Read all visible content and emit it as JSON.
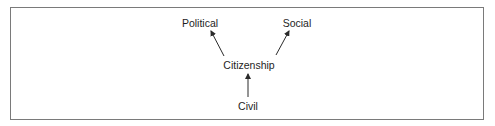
{
  "diagram": {
    "nodes": [
      {
        "id": "political",
        "label": "Political"
      },
      {
        "id": "social",
        "label": "Social"
      },
      {
        "id": "citizenship",
        "label": "Citizenship"
      },
      {
        "id": "civil",
        "label": "Civil"
      }
    ],
    "edges": [
      {
        "from": "citizenship",
        "to": "political"
      },
      {
        "from": "citizenship",
        "to": "social"
      },
      {
        "from": "civil",
        "to": "citizenship"
      }
    ],
    "colors": {
      "border": "#7a7a7a",
      "text": "#1e1e1e",
      "arrow": "#2a2a2a"
    }
  }
}
